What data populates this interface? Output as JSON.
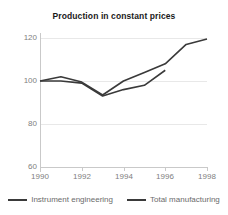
{
  "chart_data": {
    "type": "line",
    "title": "Production in constant prices",
    "xlabel": "",
    "ylabel": "",
    "ylim": [
      60,
      120
    ],
    "xlim": [
      1990,
      1998
    ],
    "yticks": [
      60,
      80,
      100,
      120
    ],
    "xticks": [
      1990,
      1992,
      1994,
      1996,
      1998
    ],
    "x": [
      1990,
      1991,
      1992,
      1993,
      1994,
      1995,
      1996,
      1997,
      1998
    ],
    "grid": true,
    "legend_position": "bottom",
    "series": [
      {
        "name": "Instrument engineering",
        "color": "#3a3a3a",
        "values": [
          100,
          100,
          99,
          93,
          96,
          98,
          105,
          null,
          null
        ]
      },
      {
        "name": "Total manufacturing",
        "color": "#3a3a3a",
        "values": [
          100,
          102,
          99.5,
          93.5,
          100,
          104,
          108,
          117,
          119.5
        ]
      }
    ]
  },
  "axis": {
    "ytick_labels": [
      "120",
      "100",
      "80",
      "60"
    ],
    "xtick_labels": [
      "1990",
      "1992",
      "1994",
      "1996",
      "1998"
    ]
  },
  "legend": {
    "items": [
      {
        "label": "Instrument engineering"
      },
      {
        "label": "Total manufacturing"
      }
    ]
  },
  "colors": {
    "line": "#3a3a3a",
    "grid": "#e8e8e8",
    "axis": "#c9c9c9",
    "tick_text": "#808080",
    "title_text": "#1a1a1a",
    "legend_text": "#6b6b6b",
    "background": "#ffffff"
  }
}
